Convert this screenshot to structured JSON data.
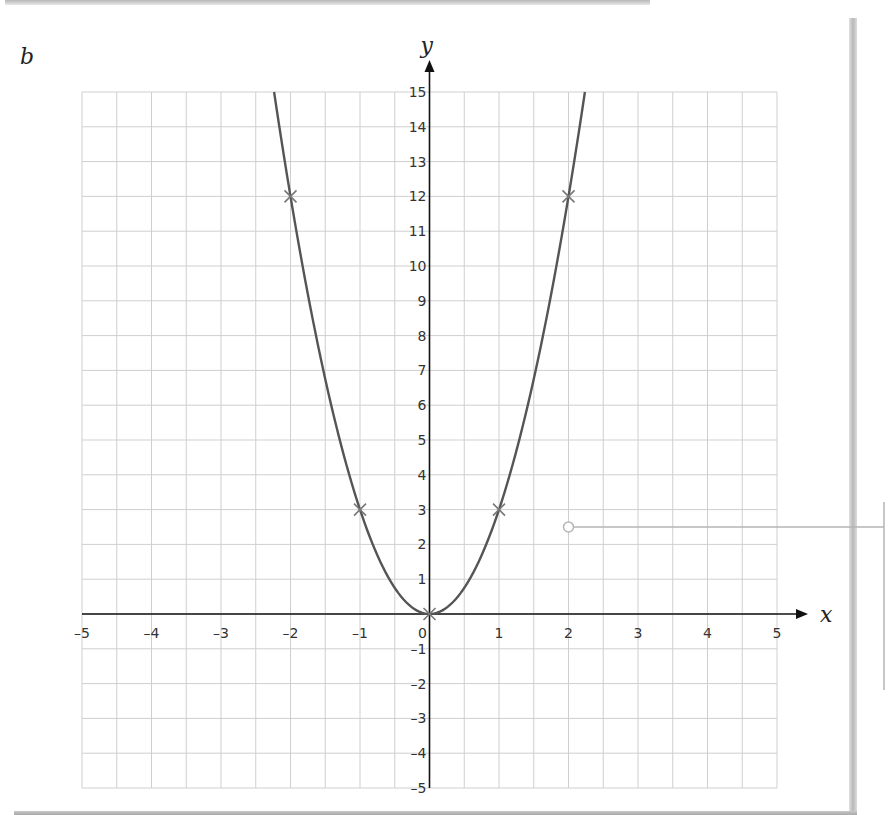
{
  "part_label": "b",
  "chart_data": {
    "type": "line",
    "title": "",
    "function": "y = 3x^2",
    "xlabel": "x",
    "ylabel": "y",
    "xlim": [
      -5,
      5
    ],
    "ylim": [
      -5,
      15
    ],
    "grid": true,
    "x_ticks": [
      -5,
      -4,
      -3,
      -2,
      -1,
      1,
      2,
      3,
      4,
      5
    ],
    "x_tick_labels": [
      "–5",
      "–4",
      "–3",
      "–2",
      "–1",
      "1",
      "2",
      "3",
      "4",
      "5"
    ],
    "origin_label": "0",
    "y_ticks": [
      15,
      14,
      13,
      12,
      11,
      10,
      9,
      8,
      7,
      6,
      5,
      4,
      3,
      2,
      1,
      -1,
      -2,
      -3,
      -4,
      -5
    ],
    "y_tick_labels": [
      "15",
      "14",
      "13",
      "12",
      "11",
      "10",
      "9",
      "8",
      "7",
      "6",
      "5",
      "4",
      "3",
      "2",
      "1",
      "–1",
      "–2",
      "–3",
      "–4",
      "–5"
    ],
    "series": [
      {
        "name": "y = 3x^2",
        "points": [
          {
            "x": -2,
            "y": 12
          },
          {
            "x": -1,
            "y": 3
          },
          {
            "x": 0,
            "y": 0
          },
          {
            "x": 1,
            "y": 3
          },
          {
            "x": 2,
            "y": 12
          }
        ]
      }
    ],
    "annotation": {
      "x": 2,
      "y": 2.5,
      "type": "callout-leader"
    },
    "colors": {
      "curve": "#555555",
      "marker": "#777777",
      "grid": "#cfcfcf",
      "axis": "#111111",
      "leader": "#b5b5b5"
    }
  }
}
